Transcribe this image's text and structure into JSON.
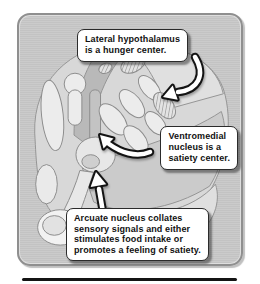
{
  "figure": {
    "callouts": [
      {
        "id": "lateral-hypothalamus",
        "text": "Lateral hypothalamus\nis a hunger center."
      },
      {
        "id": "ventromedial-nucleus",
        "text": "Ventromedial\nnucleus is a\nsatiety center."
      },
      {
        "id": "arcuate-nucleus",
        "text": "Arcuate nucleus collates\nsensory signals and either\nstimulates food intake or\npromotes a feeling of satiety."
      }
    ],
    "icons": [
      "curved-arrow-down-left-icon",
      "curved-arrow-left-icon",
      "arrow-up-icon"
    ],
    "colors": {
      "panel_bg": "#c8c8c8",
      "panel_border": "#8f8f8f",
      "callout_bg": "#ffffff",
      "callout_border": "#2b2b2b",
      "callout_text": "#111111",
      "arrow_fill": "#ffffff",
      "arrow_outline": "#141414",
      "divider": "#141414"
    }
  }
}
